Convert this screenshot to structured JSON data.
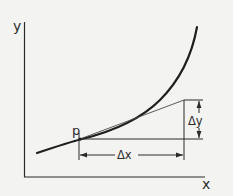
{
  "diagram": {
    "title": "",
    "labels": {
      "y_axis": "y",
      "x_axis": "x",
      "point": "p",
      "delta_x": "Δx",
      "delta_y": "Δy"
    },
    "colors": {
      "background": "#f3f3f1",
      "ink": "#2a2a2a",
      "thin_line": "#4a4a4a"
    },
    "elements": [
      {
        "type": "axis",
        "name": "y-axis",
        "label": "y"
      },
      {
        "type": "axis",
        "name": "x-axis",
        "label": "x"
      },
      {
        "type": "curve",
        "name": "increasing-convex-curve"
      },
      {
        "type": "point",
        "name": "point-p",
        "label": "p"
      },
      {
        "type": "line",
        "name": "tangent-line",
        "from": "p"
      },
      {
        "type": "line",
        "name": "horizontal-run-line",
        "from": "p"
      },
      {
        "type": "dimension",
        "name": "delta-x-dimension",
        "label": "Δx"
      },
      {
        "type": "dimension",
        "name": "delta-y-dimension",
        "label": "Δy"
      }
    ]
  }
}
